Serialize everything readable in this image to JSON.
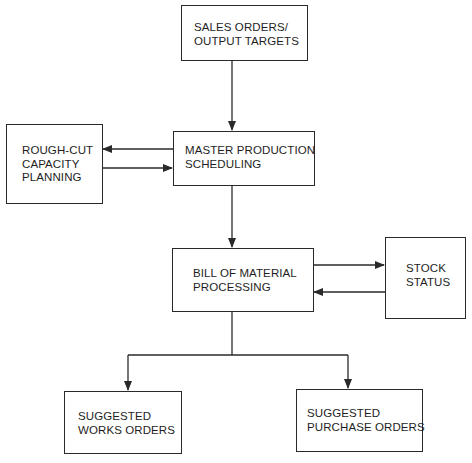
{
  "diagram": {
    "type": "flowchart",
    "colors": {
      "line": "#2a2a2a",
      "text": "#1e1e1e",
      "background": "#ffffff"
    },
    "nodes": {
      "sales_orders": {
        "label": "SALES ORDERS/\nOUTPUT TARGETS"
      },
      "rough_cut": {
        "label": "ROUGH-CUT\nCAPACITY\nPLANNING"
      },
      "mps": {
        "label": "MASTER PRODUCTION\nSCHEDULING"
      },
      "bom": {
        "label": "BILL OF MATERIAL\nPROCESSING"
      },
      "stock_status": {
        "label": "STOCK\nSTATUS"
      },
      "works_orders": {
        "label": "SUGGESTED\nWORKS ORDERS"
      },
      "purchase_orders": {
        "label": "SUGGESTED\nPURCHASE ORDERS"
      }
    },
    "edges": [
      {
        "from": "sales_orders",
        "to": "mps"
      },
      {
        "from": "mps",
        "to": "rough_cut"
      },
      {
        "from": "rough_cut",
        "to": "mps"
      },
      {
        "from": "mps",
        "to": "bom"
      },
      {
        "from": "bom",
        "to": "stock_status"
      },
      {
        "from": "stock_status",
        "to": "bom"
      },
      {
        "from": "bom",
        "to": "works_orders"
      },
      {
        "from": "bom",
        "to": "purchase_orders"
      }
    ]
  }
}
